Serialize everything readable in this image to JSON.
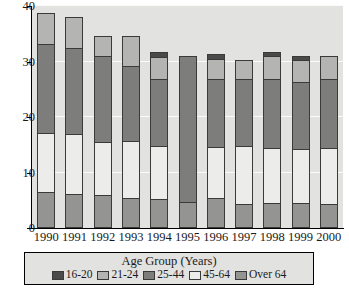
{
  "chart_data": {
    "type": "bar",
    "subtype": "stacked-vertical",
    "title": "",
    "xlabel": "",
    "ylabel": "",
    "ylim": [
      0,
      40
    ],
    "yticks": [
      0,
      10,
      20,
      30,
      40
    ],
    "ytick_labels": [
      "0",
      "10",
      "20",
      "30",
      "40"
    ],
    "grid": true,
    "grid_orientation": "horizontal",
    "legend_position": "bottom",
    "legend_title": "Age Group (Years)",
    "categories": [
      "1990",
      "1991",
      "1992",
      "1993",
      "1994",
      "1995",
      "1996",
      "1997",
      "1998",
      "1999",
      "2000"
    ],
    "stack_order_bottom_to_top": [
      "Over 64",
      "45-64",
      "25-44",
      "21-24",
      "16-20"
    ],
    "series": [
      {
        "name": "16-20",
        "color": "#4a4a4a",
        "values": [
          0.0,
          0.0,
          0.0,
          0.0,
          0.8,
          0.0,
          0.8,
          0.0,
          0.8,
          0.8,
          0.0
        ]
      },
      {
        "name": "21-24",
        "color": "#b4b4b2",
        "values": [
          5.5,
          5.7,
          3.6,
          5.3,
          4.0,
          0.0,
          3.6,
          3.4,
          4.2,
          3.9,
          4.2
        ]
      },
      {
        "name": "25-44",
        "color": "#7d7d7b",
        "values": [
          16.0,
          15.4,
          15.5,
          13.6,
          12.1,
          26.4,
          12.3,
          12.1,
          12.3,
          12.1,
          12.4
        ]
      },
      {
        "name": "45-64",
        "color": "#ececeb",
        "values": [
          10.7,
          10.9,
          9.5,
          10.2,
          9.5,
          0.0,
          9.2,
          10.4,
          10.0,
          9.8,
          10.1
        ]
      },
      {
        "name": "Over 64",
        "color": "#949492",
        "values": [
          6.3,
          5.9,
          5.8,
          5.3,
          5.1,
          4.5,
          5.2,
          4.2,
          4.3,
          4.3,
          4.2
        ]
      }
    ],
    "totals": [
      38.5,
      37.9,
      34.4,
      34.4,
      31.5,
      30.9,
      31.1,
      30.1,
      31.6,
      30.9,
      30.9
    ]
  },
  "legend": {
    "title": "Age Group (Years)",
    "entries": [
      {
        "label": "16-20",
        "color": "#4a4a4a"
      },
      {
        "label": "21-24",
        "color": "#b4b4b2"
      },
      {
        "label": "25-44",
        "color": "#7d7d7b"
      },
      {
        "label": "45-64",
        "color": "#ececeb"
      },
      {
        "label": "Over 64",
        "color": "#949492"
      }
    ]
  },
  "style": {
    "plot_background": "#e2e2e0",
    "gridline_color": "#fbfbfa",
    "axis_color": "#000000",
    "bar_border_color": "#3a3a3a",
    "page_background": "#ffffff"
  }
}
